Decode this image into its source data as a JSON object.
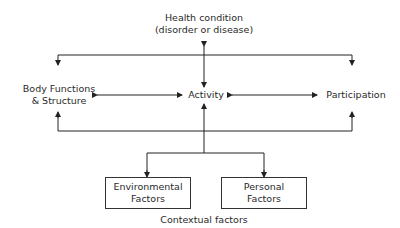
{
  "diagram": {
    "nodes": {
      "health_condition": {
        "line1": "Health condition",
        "line2": "(disorder or disease)"
      },
      "body_functions": {
        "line1": "Body Functions",
        "line2": "& Structure"
      },
      "activity": {
        "label": "Activity"
      },
      "participation": {
        "label": "Participation"
      },
      "environmental_factors": {
        "line1": "Environmental",
        "line2": "Factors"
      },
      "personal_factors": {
        "line1": "Personal",
        "line2": "Factors"
      }
    },
    "caption": "Contextual factors",
    "edges": [
      {
        "from": "health_condition",
        "to": "activity",
        "type": "bidirectional"
      },
      {
        "from": "body_functions",
        "to": "activity",
        "type": "bidirectional"
      },
      {
        "from": "activity",
        "to": "participation",
        "type": "bidirectional"
      },
      {
        "from": "top-bus",
        "to": "body_functions",
        "type": "arrow"
      },
      {
        "from": "top-bus",
        "to": "participation",
        "type": "arrow"
      },
      {
        "from": "bottom-bus",
        "to": "body_functions",
        "type": "arrow"
      },
      {
        "from": "bottom-bus",
        "to": "participation",
        "type": "arrow"
      },
      {
        "from": "contextual-branch",
        "to": "activity",
        "type": "arrow"
      },
      {
        "from": "contextual-branch",
        "to": "environmental_factors",
        "type": "arrow"
      },
      {
        "from": "contextual-branch",
        "to": "personal_factors",
        "type": "arrow"
      }
    ],
    "colors": {
      "line": "#222222",
      "text": "#2a2a2a",
      "background": "#ffffff"
    }
  }
}
